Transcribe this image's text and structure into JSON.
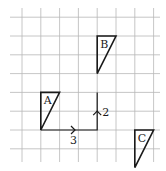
{
  "diagram": {
    "type": "grid-translation",
    "grid": {
      "columns": 8,
      "rows": 8
    },
    "shapes": [
      {
        "label": "A",
        "vertices": [
          [
            1,
            3
          ],
          [
            2,
            3
          ],
          [
            1,
            5
          ]
        ]
      },
      {
        "label": "B",
        "vertices": [
          [
            4,
            0
          ],
          [
            5,
            0
          ],
          [
            4,
            2
          ]
        ]
      },
      {
        "label": "C",
        "vertices": [
          [
            6,
            5
          ],
          [
            7,
            5
          ],
          [
            6,
            7
          ]
        ]
      }
    ],
    "translation_path": [
      [
        1,
        5
      ],
      [
        4,
        5
      ],
      [
        4,
        3
      ]
    ],
    "steps": [
      {
        "label": "3",
        "direction": "right"
      },
      {
        "label": "2",
        "direction": "up"
      }
    ],
    "colors": {
      "grid": "#b8b8b8",
      "ink": "#1a1a1a"
    }
  }
}
